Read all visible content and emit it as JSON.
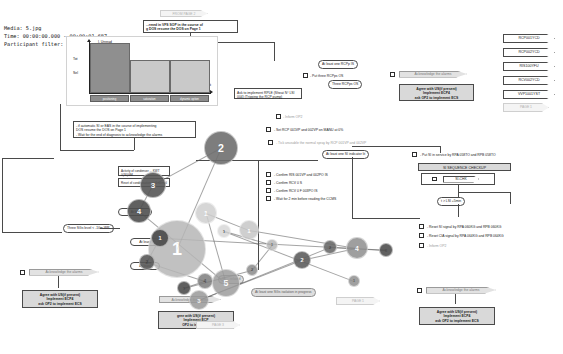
{
  "app": {
    "kind": "gaze-analysis-overlay",
    "media_label": "Media: 5.jpg",
    "time_label": "Time: 00:00:00.000 - 00:00:01.687",
    "participant_label": "Participant filter: All"
  },
  "chart_data": {
    "type": "bar",
    "title": "I. Unread",
    "categories": [
      "positioning",
      "saturation",
      "dynamic option"
    ],
    "values": [
      100,
      66,
      66
    ],
    "ylabel": "",
    "xlabel": "d sat",
    "ytick_labels": [
      "Tot",
      "Sel"
    ],
    "grid": false,
    "legend": "none"
  },
  "diagram": {
    "from_page_tag": "FROM PAGE  2",
    "top_note": {
      "line1": "...rmed in VFS SOP in the course of",
      "line2": "g DOS resume the DOS on Page 1"
    },
    "nodes": {
      "auto_si_box": {
        "line1": "- if automatic SI or EAS in the course of implementing",
        "line2": "DOS resume the DOS on Page 1",
        "line3": "- Wait for the end of diagnosis to acknowledge the alarms"
      },
      "at_least_one_rcpp_is": "At least one RCPp IS",
      "put_three_rcpps_os": "- Put three RCPps OS",
      "three_rcpps_os": "Three RCPps OS",
      "ask_rple": "Ask to implement RPLE  (Sheat N° LSI 004) (Tripping the RCP pump)",
      "ack_alarms_top": "Acknowledge the alarms",
      "agree_us_top": {
        "line1": "Agree with US(if present)",
        "line2": "Implement ECP4",
        "line3": "ask OP2 to implement ECS"
      },
      "inform_op2_top": "- Inform OP2",
      "set_rcp_manu": "- Set  RCP 001VP and 002VP on MANU at 0%",
      "tick_unusable": "- Tick unusable the normal spray by RCP 001VP and 002VP",
      "at_least_one_si_lit": "At least one SI indicator lit",
      "put_si_in_service": "- Put SI in service by RPA 058TO and RPB 058TO",
      "si_sequence_checkup": "SI SEQUENCE CHECKUP",
      "si_chk": "SI-CHK",
      "t_lsi": "t > LSI +5min",
      "confirm_ris": "- Confirm RIS 001VP and 002PO IS",
      "confirm_rcv1": "- Confirm RCV 0   S",
      "confirm_rcv2": "- Confirm RCV 0   F 003PO IS",
      "wait_ccms": "- Wait for 2 min before reading the CCMS",
      "reset_si_rpa": "- Reset SI signal by RPA 060KG and RPB 060KG",
      "reset_cia_rpa": "- Reset CIA signal by RPA 064KG and RPB 064KG",
      "inform_op2_right": "- Inform OP2",
      "activity_condenser": "Activity of condenser   ...   KWT 0(30)GM",
      "reset_condenser": "Reset of condensation well normal",
      "three_sgs_level": "Three SGs level < -10m WR",
      "at_least_label_a": "At lea",
      "at_least_label_b": "At least",
      "at_least_label_c": "At least",
      "at_least_label_d": "10",
      "at_least_label_e": "m",
      "si_related": "SI ... related",
      "at_least_sgs_iso": "At least one SGs isolation in progress",
      "sgs_isolated": "...SGs isolated",
      "ack_alarms_bl": "Acknowledge the alarms",
      "agree_us_bl": {
        "line1": "Agree with US(if present)",
        "line2": "Implement ECP4",
        "line3": "ask OP2 to implement ECS"
      },
      "ack_alarms_bc": "Acknowledge the alarms",
      "agree_us_bc": {
        "line1": "gree with US(if present)",
        "line2": "Implement ECP",
        "line3": "OP2 to implemen"
      },
      "ack_alarms_br": "Acknowledge the alarms",
      "agree_us_br": {
        "line1": "Agree with US(if present)",
        "line2": "Implement ECP4",
        "line3": "ask OP2 to implement ECS"
      },
      "page_tag_bottom_left": "PAGE  3",
      "page_tag_bottom_mid": "PAGE  1"
    },
    "side_tags": [
      "RCP001YCD",
      "RCP002YCD",
      "RIS100YFU",
      "RCV002YCD",
      "VVP1001YST"
    ],
    "side_tag_page": "PAGE  1"
  },
  "gaze": {
    "bubbles": [
      {
        "n": "1",
        "x": 177,
        "y": 249,
        "r": 29,
        "c": "#b7b7b7",
        "o": 0.85
      },
      {
        "n": "2",
        "x": 221,
        "y": 148,
        "r": 17,
        "c": "#6f6f6f",
        "o": 0.9
      },
      {
        "n": "3",
        "x": 153,
        "y": 185,
        "r": 13,
        "c": "#575757",
        "o": 0.9
      },
      {
        "n": "4",
        "x": 139,
        "y": 211,
        "r": 12,
        "c": "#4f4f4f",
        "o": 0.9
      },
      {
        "n": "5",
        "x": 226,
        "y": 283,
        "r": 14,
        "c": "#9d9d9d",
        "o": 0.85
      },
      {
        "n": "1",
        "x": 206,
        "y": 213,
        "r": 11,
        "c": "#cfcfcf",
        "o": 0.85
      },
      {
        "n": "1",
        "x": 249,
        "y": 230,
        "r": 10,
        "c": "#c7c7c7",
        "o": 0.85
      },
      {
        "n": "4",
        "x": 357,
        "y": 248,
        "r": 11,
        "c": "#8f8f8f",
        "o": 0.85
      },
      {
        "n": "2",
        "x": 302,
        "y": 260,
        "r": 9,
        "c": "#5f5f5f",
        "o": 0.9
      },
      {
        "n": "3",
        "x": 199,
        "y": 300,
        "r": 10,
        "c": "#9a9a9a",
        "o": 0.85
      },
      {
        "n": "2",
        "x": 330,
        "y": 247,
        "r": 7,
        "c": "#6b6b6b",
        "o": 0.9
      },
      {
        "n": "3",
        "x": 386,
        "y": 250,
        "r": 7,
        "c": "#505050",
        "o": 0.9
      },
      {
        "n": "1",
        "x": 160,
        "y": 238,
        "r": 9,
        "c": "#4a4a4a",
        "o": 0.9
      },
      {
        "n": "2",
        "x": 147,
        "y": 262,
        "r": 8,
        "c": "#585858",
        "o": 0.9
      },
      {
        "n": "4",
        "x": 205,
        "y": 281,
        "r": 8,
        "c": "#7d7d7d",
        "o": 0.85
      },
      {
        "n": "1",
        "x": 184,
        "y": 288,
        "r": 7,
        "c": "#4e4e4e",
        "o": 0.9
      },
      {
        "n": "2",
        "x": 252,
        "y": 270,
        "r": 6,
        "c": "#8a8a8a",
        "o": 0.85
      },
      {
        "n": "1",
        "x": 272,
        "y": 245,
        "r": 6,
        "c": "#b3b3b3",
        "o": 0.8
      },
      {
        "n": "1",
        "x": 224,
        "y": 231,
        "r": 7,
        "c": "#d5d5d5",
        "o": 0.8
      },
      {
        "n": "1",
        "x": 354,
        "y": 281,
        "r": 6,
        "c": "#909090",
        "o": 0.85
      }
    ]
  }
}
